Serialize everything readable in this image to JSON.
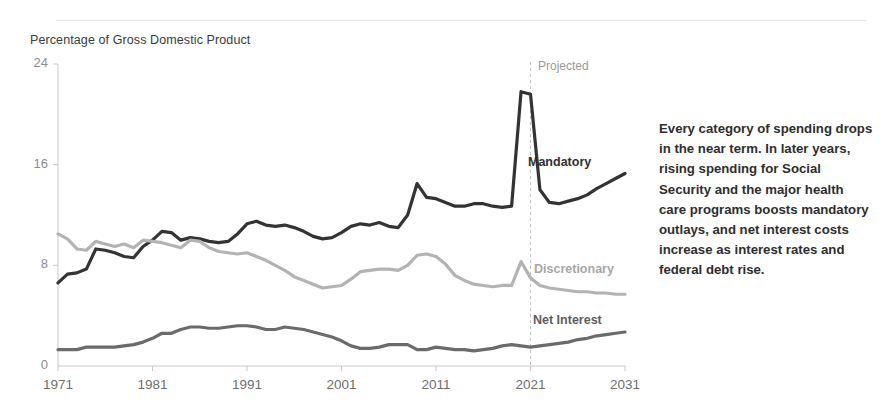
{
  "chart_data": {
    "type": "line",
    "title": "Percentage of Gross Domestic Product",
    "xlabel": "",
    "ylabel": "Percentage of Gross Domestic Product",
    "xlim": [
      1971,
      2031
    ],
    "ylim": [
      0,
      24
    ],
    "yticks": [
      "0",
      "8",
      "16",
      "24"
    ],
    "xticks": [
      "1971",
      "1981",
      "1991",
      "2001",
      "2011",
      "2021",
      "2031"
    ],
    "grid": false,
    "legend_position": "inline-right-of-series",
    "annotations": [
      {
        "name": "projected-divider",
        "label": "Projected",
        "x": 2021,
        "style": "dashed-vertical-line"
      }
    ],
    "x": [
      1971,
      1972,
      1973,
      1974,
      1975,
      1976,
      1977,
      1978,
      1979,
      1980,
      1981,
      1982,
      1983,
      1984,
      1985,
      1986,
      1987,
      1988,
      1989,
      1990,
      1991,
      1992,
      1993,
      1994,
      1995,
      1996,
      1997,
      1998,
      1999,
      2000,
      2001,
      2002,
      2003,
      2004,
      2005,
      2006,
      2007,
      2008,
      2009,
      2010,
      2011,
      2012,
      2013,
      2014,
      2015,
      2016,
      2017,
      2018,
      2019,
      2020,
      2021,
      2022,
      2023,
      2024,
      2025,
      2026,
      2027,
      2028,
      2029,
      2030,
      2031
    ],
    "series": [
      {
        "name": "Mandatory",
        "color": "#333333",
        "values": [
          6.6,
          7.3,
          7.4,
          7.7,
          9.3,
          9.2,
          9.0,
          8.7,
          8.6,
          9.5,
          10.0,
          10.7,
          10.6,
          10.0,
          10.2,
          10.1,
          9.9,
          9.8,
          9.9,
          10.5,
          11.3,
          11.5,
          11.2,
          11.1,
          11.2,
          11.0,
          10.7,
          10.3,
          10.1,
          10.2,
          10.6,
          11.1,
          11.3,
          11.2,
          11.4,
          11.1,
          11.0,
          12.0,
          14.5,
          13.4,
          13.3,
          13.0,
          12.7,
          12.7,
          12.9,
          12.9,
          12.7,
          12.6,
          12.7,
          21.8,
          21.6,
          14.0,
          13.0,
          12.9,
          13.1,
          13.3,
          13.6,
          14.1,
          14.5,
          14.9,
          15.3
        ]
      },
      {
        "name": "Discretionary",
        "color": "#b3b3b3",
        "values": [
          10.5,
          10.1,
          9.3,
          9.2,
          9.9,
          9.7,
          9.5,
          9.7,
          9.4,
          10.0,
          9.9,
          9.8,
          9.6,
          9.4,
          10.0,
          9.9,
          9.4,
          9.1,
          9.0,
          8.9,
          9.0,
          8.7,
          8.4,
          8.0,
          7.6,
          7.1,
          6.8,
          6.5,
          6.2,
          6.3,
          6.4,
          6.9,
          7.5,
          7.6,
          7.7,
          7.7,
          7.6,
          8.0,
          8.8,
          8.9,
          8.7,
          8.1,
          7.2,
          6.8,
          6.5,
          6.4,
          6.3,
          6.4,
          6.4,
          8.3,
          7.0,
          6.4,
          6.2,
          6.1,
          6.0,
          5.9,
          5.9,
          5.8,
          5.8,
          5.7,
          5.7
        ]
      },
      {
        "name": "Net Interest",
        "color": "#6b6b6b",
        "values": [
          1.3,
          1.3,
          1.3,
          1.5,
          1.5,
          1.5,
          1.5,
          1.6,
          1.7,
          1.9,
          2.2,
          2.6,
          2.6,
          2.9,
          3.1,
          3.1,
          3.0,
          3.0,
          3.1,
          3.2,
          3.2,
          3.1,
          2.9,
          2.9,
          3.1,
          3.0,
          2.9,
          2.7,
          2.5,
          2.3,
          2.0,
          1.6,
          1.4,
          1.4,
          1.5,
          1.7,
          1.7,
          1.7,
          1.3,
          1.3,
          1.5,
          1.4,
          1.3,
          1.3,
          1.2,
          1.3,
          1.4,
          1.6,
          1.7,
          1.6,
          1.5,
          1.6,
          1.7,
          1.8,
          1.9,
          2.1,
          2.2,
          2.4,
          2.5,
          2.6,
          2.7
        ]
      }
    ]
  },
  "labels": {
    "mandatory": "Mandatory",
    "discretionary": "Discretionary",
    "net_interest": "Net Interest",
    "projected": "Projected"
  },
  "caption": {
    "text": "Every category of spending drops in the near term. In later years, rising spending for Social Security and the major health care programs boosts mandatory outlays, and net interest costs increase as interest rates and federal debt rise."
  }
}
